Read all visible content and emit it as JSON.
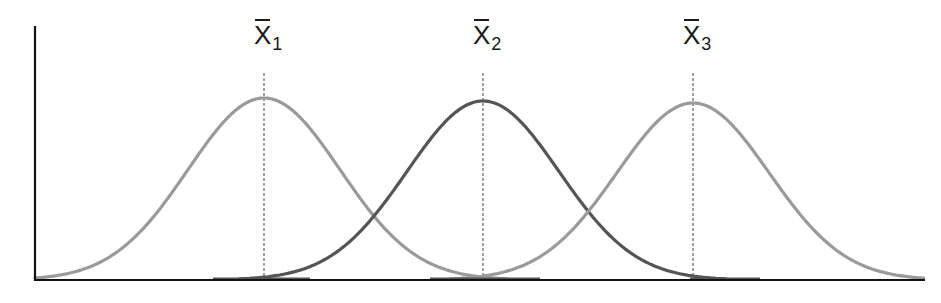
{
  "chart_data": {
    "type": "line",
    "title": "",
    "xlabel": "",
    "ylabel": "",
    "grid": false,
    "legend": null,
    "series": [
      {
        "name": "Distribution 1",
        "label_base": "X",
        "label_sub": "1",
        "mean_px": 264,
        "sigma_px": 76,
        "peak_y_px": 98,
        "color": "#9a9a9a"
      },
      {
        "name": "Distribution 2",
        "label_base": "X",
        "label_sub": "2",
        "mean_px": 483,
        "sigma_px": 76,
        "peak_y_px": 101,
        "color": "#555555"
      },
      {
        "name": "Distribution 3",
        "label_base": "X",
        "label_sub": "3",
        "mean_px": 693,
        "sigma_px": 76,
        "peak_y_px": 103,
        "color": "#9a9a9a"
      }
    ],
    "annotations": [
      "x̄1",
      "x̄2",
      "x̄3"
    ],
    "axes": {
      "origin_px": [
        35,
        280
      ],
      "x_end_px": 925,
      "y_top_px": 26,
      "color": "#111111"
    },
    "mean_line": {
      "top_px": 73,
      "color": "#8a8a8a",
      "dash": "3,2"
    },
    "baseline_segments": [
      [
        213,
        310
      ],
      [
        430,
        540
      ],
      [
        690,
        760
      ]
    ]
  }
}
